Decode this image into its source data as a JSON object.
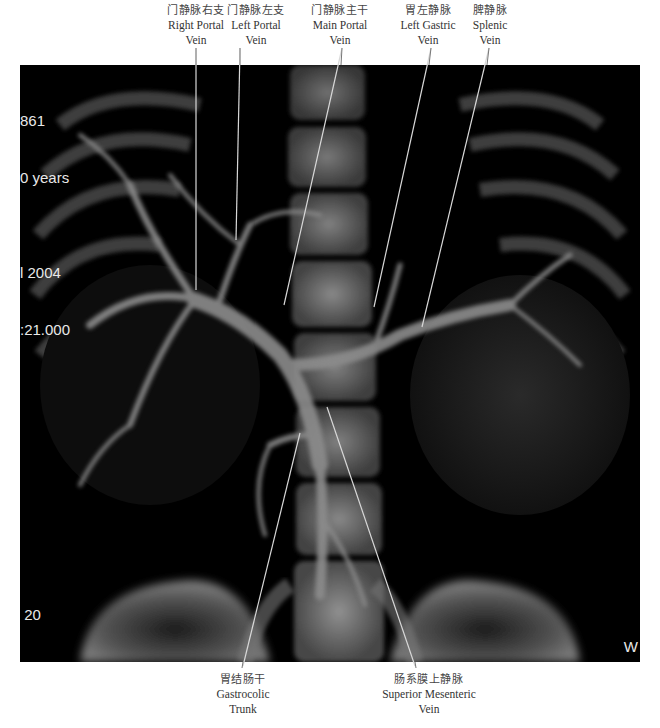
{
  "figure": {
    "type": "3D CT portal venography (MIP/VR reconstruction), coronal view",
    "overlay": {
      "top_left": [
        "861",
        "0 years",
        "",
        "l 2004",
        ":21.000"
      ],
      "bottom_left": [
        " 20",
        "20",
        ":500",
        "210",
        " mm",
        "on",
        "  ..30:30.00"
      ],
      "bottom_right": "W"
    },
    "labels_top": [
      {
        "id": "right-portal-vein",
        "zh": "门静脉右支",
        "en_line1": "Right Portal",
        "en_line2": "Vein"
      },
      {
        "id": "left-portal-vein",
        "zh": "门静脉左支",
        "en_line1": "Left Portal",
        "en_line2": "Vein"
      },
      {
        "id": "main-portal-vein",
        "zh": "门静脉主干",
        "en_line1": "Main Portal",
        "en_line2": "Vein"
      },
      {
        "id": "left-gastric-vein",
        "zh": "胃左静脉",
        "en_line1": "Left Gastric",
        "en_line2": "Vein"
      },
      {
        "id": "splenic-vein",
        "zh": "脾静脉",
        "en_line1": "Splenic",
        "en_line2": "Vein"
      }
    ],
    "labels_bottom": [
      {
        "id": "gastrocolic-trunk",
        "zh": "胃结肠干",
        "en_line1": "Gastrocolic",
        "en_line2": "Trunk"
      },
      {
        "id": "superior-mesenteric-vein",
        "zh": "肠系膜上静脉",
        "en_line1": "Superior Mesenteric",
        "en_line2": "Vein"
      }
    ],
    "colors": {
      "background": "#ffffff",
      "scan_background": "#000000",
      "leader_line": "#d8d8d8",
      "label_text": "#333333"
    }
  }
}
